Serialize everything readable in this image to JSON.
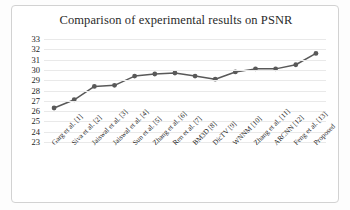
{
  "chart_data": {
    "type": "line",
    "title": "Comparison of experimental results on PSNR",
    "xlabel": "",
    "ylabel": "",
    "ylim": [
      23,
      33
    ],
    "yticks": [
      33,
      32,
      31,
      30,
      29,
      28,
      27,
      26,
      25,
      24,
      23
    ],
    "grid": true,
    "legend": "none",
    "marker": "circle",
    "series_color": "#595959",
    "grid_color": "#e9e9e9",
    "categories": [
      "Garg et al. [1]",
      "Siva et al. [2]",
      "Jaiswal et al. [3]",
      "Jaiswal et al. [4]",
      "Sun et al. [5]",
      "Zhang et al. [6]",
      "Ren et al. [7]",
      "BM3D [8]",
      "DicTV [9]",
      "WNNM [10]",
      "Zhang et al. [11]",
      "ARCNN [12]",
      "Feng et al. [13]",
      "Proposed"
    ],
    "values": [
      26.3,
      27.1,
      28.4,
      28.5,
      29.4,
      29.6,
      29.7,
      29.4,
      29.1,
      29.8,
      30.1,
      30.1,
      30.5,
      31.6
    ]
  }
}
